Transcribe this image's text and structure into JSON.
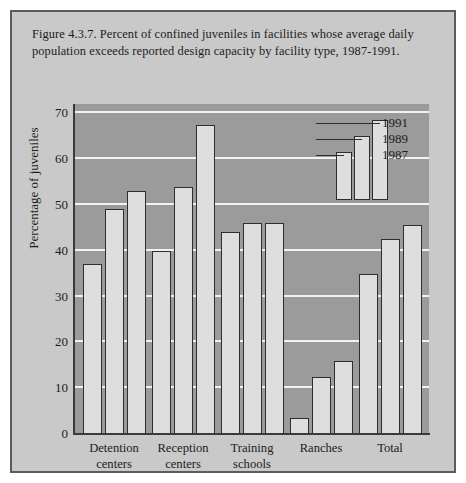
{
  "figure": {
    "caption": "Figure 4.3.7. Percent of confined juveniles in facilities whose average daily population exceeds reported design capacity by facility type,  1987-1991."
  },
  "colors": {
    "panel_background": "#c9c9c9",
    "panel_border": "#5c5c5c",
    "plot_background": "#9b9b9b",
    "gridline": "#f2f2f2",
    "bar_fill": "#dedede",
    "bar_outline": "#2e2e2e",
    "text": "#1c1c1c"
  },
  "legend": {
    "entries": [
      {
        "label": "1991"
      },
      {
        "label": "1989"
      },
      {
        "label": "1987"
      }
    ]
  },
  "chart_data": {
    "type": "bar",
    "title": "Figure 4.3.7. Percent of confined juveniles in facilities whose average daily population exceeds reported design capacity by facility type,  1987-1991.",
    "xlabel": "",
    "ylabel": "Percentage of juveniles",
    "ylim": [
      0,
      72
    ],
    "yticks": [
      0,
      10,
      20,
      30,
      40,
      50,
      60,
      70
    ],
    "ytick_labels": [
      "0",
      "10",
      "20",
      "30",
      "40",
      "50",
      "60",
      "70"
    ],
    "grid": true,
    "legend_position": "upper-center",
    "categories": [
      "Detention centers",
      "Reception centers",
      "Training schools",
      "Ranches",
      "Total"
    ],
    "category_lines": [
      [
        "Detention",
        "centers"
      ],
      [
        "Reception",
        "centers"
      ],
      [
        "Training",
        "schools"
      ],
      [
        "Ranches",
        ""
      ],
      [
        "Total",
        ""
      ]
    ],
    "series": [
      {
        "name": "1987",
        "values": [
          37,
          40,
          44,
          3.5,
          35
        ]
      },
      {
        "name": "1989",
        "values": [
          49,
          54,
          46,
          12.5,
          42.5
        ]
      },
      {
        "name": "1991",
        "values": [
          53,
          67.5,
          46,
          16,
          45.5
        ]
      }
    ]
  }
}
